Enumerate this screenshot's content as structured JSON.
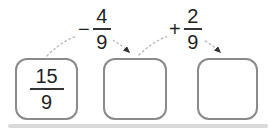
{
  "diagram": {
    "boxes": {
      "start": {
        "numerator": "15",
        "denominator": "9"
      },
      "middle": "",
      "end": ""
    },
    "operations": {
      "subtract": {
        "sign": "−",
        "numerator": "4",
        "denominator": "9"
      },
      "add": {
        "sign": "+",
        "numerator": "2",
        "denominator": "9"
      }
    },
    "colors": {
      "box_border": "#8a8a8a",
      "text": "#1f1f1f",
      "fraction_bar": "#333333",
      "arc": "#b5b5b5",
      "arrowhead": "#333333",
      "bottom_strip": "#d9d9d9"
    }
  }
}
